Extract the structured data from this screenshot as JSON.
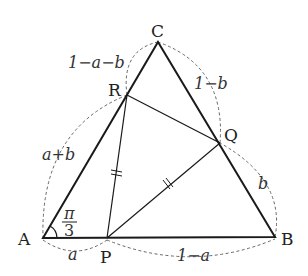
{
  "diagram": {
    "type": "geometry",
    "points": {
      "A": {
        "label": "A",
        "x": 43,
        "y": 238
      },
      "B": {
        "label": "B",
        "x": 275,
        "y": 237
      },
      "C": {
        "label": "C",
        "x": 158,
        "y": 42
      },
      "P": {
        "label": "P",
        "x": 107,
        "y": 238
      },
      "Q": {
        "label": "Q",
        "x": 220,
        "y": 143
      },
      "R": {
        "label": "R",
        "x": 127,
        "y": 95
      }
    },
    "lengths": {
      "AP": "a",
      "PB": "1−a",
      "BQ": "b",
      "QC": "1−b",
      "CR": "1−a−b",
      "RA": "a+b"
    },
    "angle_A": {
      "num": "π",
      "den": "3"
    },
    "equal_marks": [
      "RP",
      "PQ"
    ]
  }
}
